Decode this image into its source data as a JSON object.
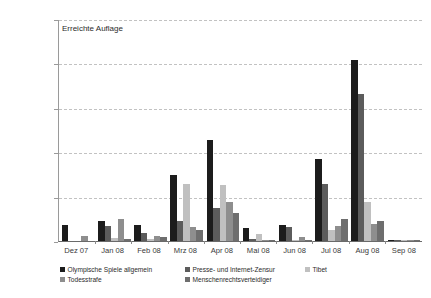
{
  "chart_data": {
    "type": "bar",
    "title": "Erreichte Auflage",
    "xlabel": "",
    "ylabel": "",
    "ylim": [
      0,
      50000000
    ],
    "grid": true,
    "legend_position": "bottom",
    "y_ticks": [
      0,
      10000000,
      20000000,
      30000000,
      40000000,
      50000000
    ],
    "y_tick_labels": [
      "0",
      "10.000.000",
      "20.000.000",
      "30.000.000",
      "40.000.000",
      "50.000.000"
    ],
    "categories": [
      "Dez 07",
      "Jan 08",
      "Feb 08",
      "Mrz 08",
      "Apr 08",
      "Mai 08",
      "Jun 08",
      "Jul 08",
      "Aug 08",
      "Sep 08"
    ],
    "series": [
      {
        "name": "Olympische Spiele allgemein",
        "color": "#1c1c1c",
        "values": [
          3700000,
          4500000,
          3500000,
          14800000,
          22800000,
          3000000,
          3700000,
          18400000,
          40800000,
          80000
        ]
      },
      {
        "name": "Presse- und Internet-Zensur",
        "color": "#5c5c5c",
        "values": [
          0,
          3400000,
          1800000,
          4400000,
          7400000,
          400000,
          3200000,
          12800000,
          33200000,
          60000
        ]
      },
      {
        "name": "Tibet",
        "color": "#c0c0c0",
        "values": [
          0,
          600000,
          500000,
          12800000,
          12600000,
          1600000,
          200000,
          2400000,
          8800000,
          40000
        ]
      },
      {
        "name": "Todesstrafe",
        "color": "#8e8e8e",
        "values": [
          1200000,
          5000000,
          1200000,
          3200000,
          8800000,
          200000,
          800000,
          3400000,
          3800000,
          40000
        ]
      },
      {
        "name": "Menschenrechtsverteidiger",
        "color": "#6e6e6e",
        "values": [
          0,
          400000,
          800000,
          2400000,
          6200000,
          60000,
          100000,
          5000000,
          4400000,
          40000
        ]
      }
    ]
  }
}
